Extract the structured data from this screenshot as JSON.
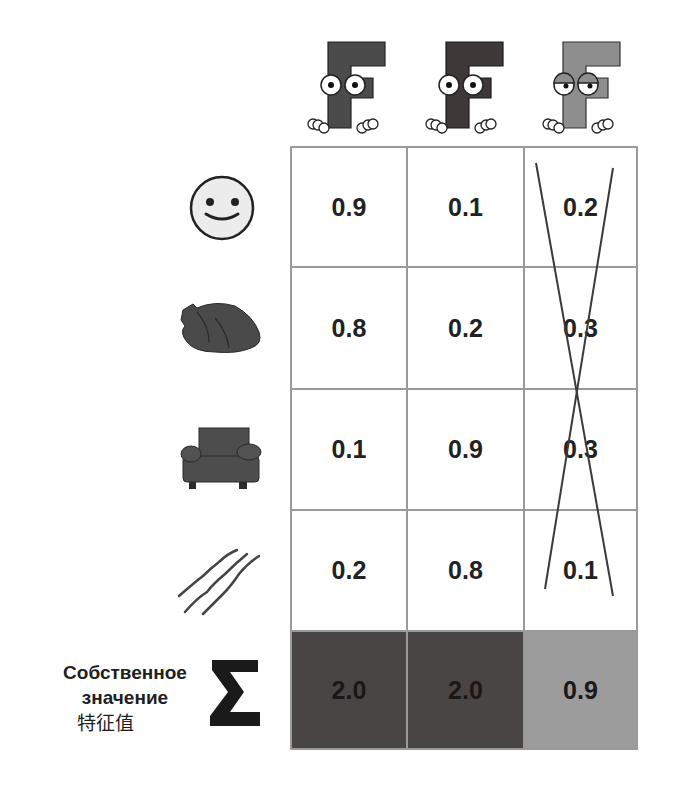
{
  "columns": [
    {
      "name": "component-1",
      "mascot": "f-mascot-dark",
      "fill": "#4b4b4b",
      "eyes": "open"
    },
    {
      "name": "component-2",
      "mascot": "f-mascot-darker",
      "fill": "#3e3838",
      "eyes": "open"
    },
    {
      "name": "component-3",
      "mascot": "f-mascot-sleepy",
      "fill": "#8e8e8e",
      "eyes": "sleepy",
      "crossed_out": true
    }
  ],
  "rows": [
    {
      "icon": "smiley-face-icon",
      "values": [
        "0.9",
        "0.1",
        "0.2"
      ]
    },
    {
      "icon": "roast-chicken-icon",
      "values": [
        "0.8",
        "0.2",
        "0.3"
      ]
    },
    {
      "icon": "armchair-icon",
      "values": [
        "0.1",
        "0.9",
        "0.3"
      ]
    },
    {
      "icon": "scratch-marks-icon",
      "values": [
        "0.2",
        "0.8",
        "0.1"
      ]
    }
  ],
  "sum_row": {
    "label_ru_line1": "Собственное",
    "label_ru_line2": "значение",
    "label_zh": "特征值",
    "symbol": "∑",
    "values": [
      "2.0",
      "2.0",
      "0.9"
    ]
  },
  "colors": {
    "grid_line": "#9a9a9a",
    "sum_dark": "#4a4545",
    "sum_light": "#9c9c9c",
    "cross_line": "#3a3a3a"
  }
}
